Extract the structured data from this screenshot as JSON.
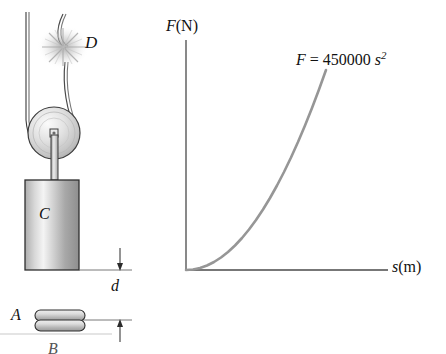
{
  "figure": {
    "labels": {
      "cut_point": "D",
      "block": "C",
      "drop_distance": "d",
      "spring": "A",
      "ground": "B"
    },
    "colors": {
      "ink": "#1a1a1a",
      "curve": "#969696",
      "axis": "#555555",
      "metal_light": "#f2f2f2",
      "metal_mid": "#c8c8c8",
      "metal_dark": "#8c8c8c"
    }
  },
  "chart_data": {
    "type": "line",
    "title": "",
    "xlabel_italic": "s",
    "xlabel_unit": "(m)",
    "ylabel_italic": "F",
    "ylabel_unit": "(N)",
    "annotation": {
      "lhs": "F",
      "equals": "=",
      "coefficient": "450000",
      "variable": "s",
      "exponent": "2",
      "full_text": "F = 450000 s2"
    },
    "equation": "F = 450000 s^2",
    "coefficient": 450000,
    "exponent": 2,
    "grid": false,
    "legend": false,
    "xlim": [
      0,
      1
    ],
    "ylim": [
      0,
      1
    ],
    "x": [
      0,
      0.05,
      0.1,
      0.15,
      0.2,
      0.25,
      0.3,
      0.35,
      0.4,
      0.45,
      0.5,
      0.55,
      0.6,
      0.65,
      0.7,
      0.75,
      0.8,
      0.85,
      0.9,
      0.95,
      1.0
    ],
    "y": [
      0,
      0.0025,
      0.01,
      0.0225,
      0.04,
      0.0625,
      0.09,
      0.1225,
      0.16,
      0.2025,
      0.25,
      0.3025,
      0.36,
      0.4225,
      0.49,
      0.5625,
      0.64,
      0.7225,
      0.81,
      0.9025,
      1.0
    ],
    "axis_ticks_x": [],
    "axis_ticks_y": []
  }
}
